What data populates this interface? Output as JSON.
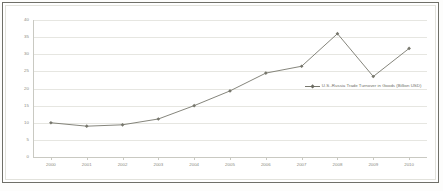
{
  "chart_data": {
    "type": "line",
    "title": "",
    "subtitle": "",
    "xlabel": "",
    "ylabel": "",
    "categories": [
      "2000",
      "2001",
      "2002",
      "2003",
      "2004",
      "2005",
      "2006",
      "2007",
      "2008",
      "2009",
      "2010"
    ],
    "series": [
      {
        "name": "U.S.-Russia Trade Turnover in Goods (Billion USD)",
        "values": [
          10.0,
          9.0,
          9.4,
          11.1,
          15.0,
          19.3,
          24.5,
          26.5,
          36.0,
          23.5,
          31.7
        ],
        "color": "#77776d",
        "marker": "diamond"
      }
    ],
    "ylim": [
      0,
      40
    ],
    "y_ticks": [
      "0",
      "5",
      "10",
      "15",
      "20",
      "25",
      "30",
      "35",
      "40"
    ],
    "y_tick_values": [
      0,
      5,
      10,
      15,
      20,
      25,
      30,
      35,
      40
    ],
    "grid": true,
    "grid_axis": "y",
    "legend": {
      "position": "center-right-inside",
      "entries": [
        "U.S.-Russia Trade Turnover in Goods (Billion USD)"
      ]
    }
  },
  "legend": {
    "label": "U.S.-Russia Trade Turnover in Goods (Billion USD)"
  },
  "colors": {
    "series_line": "#77776d",
    "series_marker": "#6b6b61",
    "gridline": "#e6e6e1",
    "axis": "#c9c9c2",
    "tick_text": "#8a8a82",
    "frame": "#6f6f68",
    "background": "#ffffff"
  }
}
